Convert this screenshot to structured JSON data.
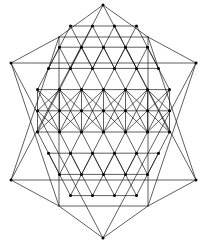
{
  "figure": {
    "alt_name": "Star Tetrahedron Lattice",
    "background_color": "#ffffff",
    "line_color": "#1a1a1a",
    "node_color": "#000000",
    "line_width": 0.7,
    "node_radius": 1.5,
    "canvas": {
      "width": 207,
      "height": 243
    }
  },
  "chart_data": {
    "type": "diagram",
    "subtype": "geometric-lattice",
    "grid": {
      "columns": 7,
      "rows": 9,
      "column_spacing": 22.0,
      "row_spacing": 21.2,
      "origin_x": 38.0,
      "origin_y": 26.0,
      "row_offset_alternating": 11.0
    },
    "star_points": [
      {
        "name": "top",
        "x": 103,
        "y": 5
      },
      {
        "name": "upper-left",
        "x": 11,
        "y": 63
      },
      {
        "name": "upper-right",
        "x": 196,
        "y": 63
      },
      {
        "name": "lower-left",
        "x": 11,
        "y": 180
      },
      {
        "name": "lower-right",
        "x": 196,
        "y": 180
      },
      {
        "name": "bottom",
        "x": 103,
        "y": 238
      }
    ],
    "inner_square": {
      "left": 59,
      "top": 37,
      "right": 148,
      "bottom": 206
    },
    "line_families": [
      "horizontal",
      "vertical",
      "diagonal-down-right",
      "diagonal-down-left"
    ],
    "node_count": 63,
    "legend": [],
    "xlabel": "",
    "ylabel": "",
    "grid_visible": true,
    "axes_visible": false
  }
}
